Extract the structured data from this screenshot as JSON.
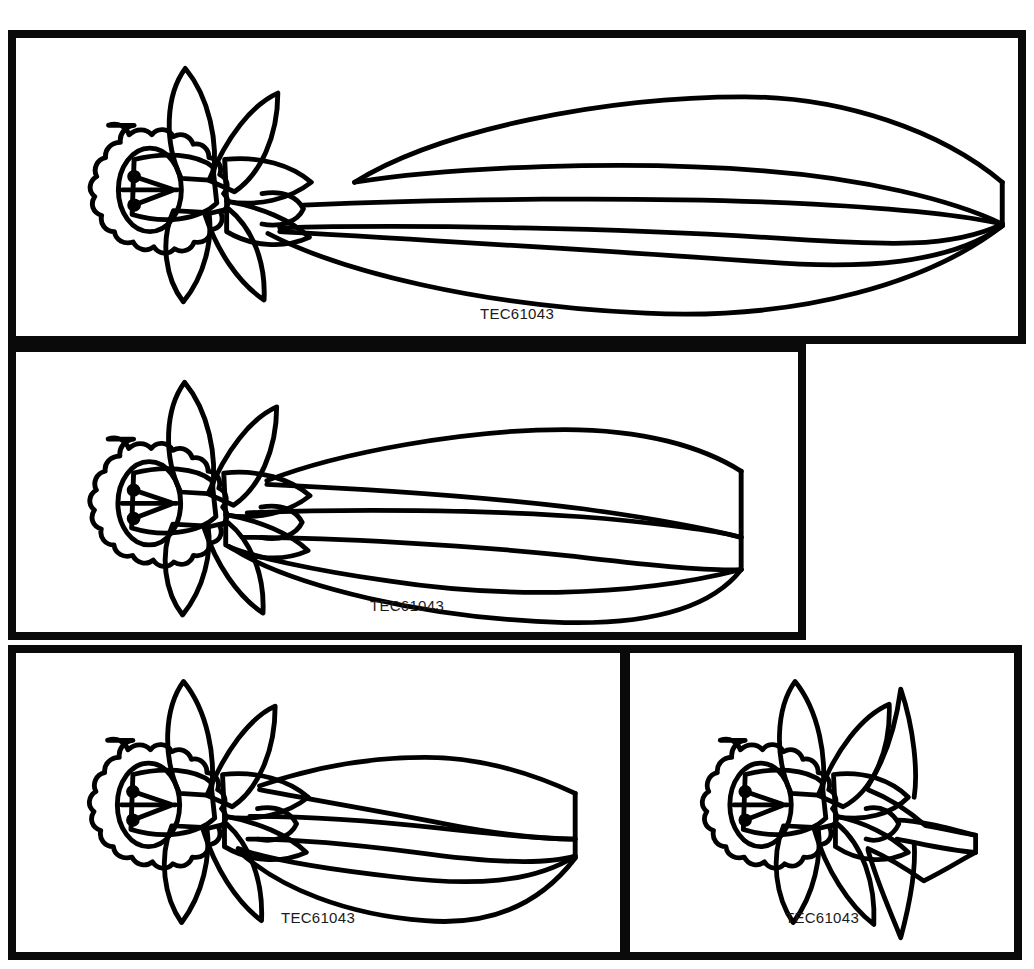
{
  "page": {
    "background_color": "#ffffff",
    "ink_color": "#000000",
    "border_color": "#0a0a0a",
    "panel_count": 4
  },
  "panels": [
    {
      "id": "panel-1",
      "position": "top-full-width",
      "caption": "TEC61043",
      "artwork_name": "daffodil-with-long-leaves",
      "leaf_count": 4,
      "aspect": "very-wide",
      "leaves_clipped_at_right": true
    },
    {
      "id": "panel-2",
      "position": "middle-left",
      "caption": "TEC61043",
      "artwork_name": "daffodil-with-long-leaves",
      "leaf_count": 3,
      "aspect": "wide",
      "leaves_clipped_at_right": true
    },
    {
      "id": "panel-3",
      "position": "bottom-left",
      "caption": "TEC61043",
      "artwork_name": "daffodil-with-medium-leaves",
      "leaf_count": 4,
      "aspect": "medium",
      "leaves_clipped_at_right": true
    },
    {
      "id": "panel-4",
      "position": "bottom-right",
      "caption": "TEC61043",
      "artwork_name": "daffodil-with-short-leaves",
      "leaf_count": 3,
      "aspect": "narrow",
      "leaves_clipped_at_right": true
    }
  ]
}
